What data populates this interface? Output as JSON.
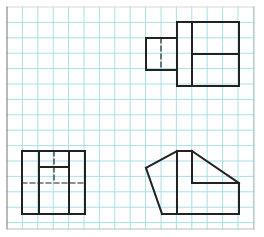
{
  "colors": {
    "background": "#ffffff",
    "grid": "#a8e0e6",
    "frame": "#8a8a8a",
    "line": "#222222"
  },
  "grid": {
    "origin_x": 7,
    "origin_y": 7,
    "spacing": 15.4,
    "width": 247,
    "height": 222
  },
  "views": [
    {
      "name": "top-right-view",
      "solid_lines": [
        [
          177,
          22,
          239,
          22
        ],
        [
          239,
          22,
          239,
          86
        ],
        [
          239,
          86,
          177,
          86
        ],
        [
          177,
          86,
          177,
          22
        ],
        [
          192,
          22,
          192,
          86
        ],
        [
          192,
          54,
          239,
          54
        ],
        [
          146,
          38,
          177,
          38
        ],
        [
          146,
          70,
          177,
          70
        ],
        [
          146,
          38,
          146,
          70
        ]
      ],
      "dashed_lines": [
        [
          161,
          38,
          161,
          70
        ]
      ]
    },
    {
      "name": "bottom-left-view",
      "solid_lines": [
        [
          22,
          151,
          85,
          151
        ],
        [
          85,
          151,
          85,
          214
        ],
        [
          85,
          214,
          22,
          214
        ],
        [
          22,
          214,
          22,
          151
        ],
        [
          39,
          151,
          39,
          214
        ],
        [
          69,
          151,
          69,
          214
        ],
        [
          39,
          167,
          69,
          167
        ]
      ],
      "dashed_lines": [
        [
          22,
          183,
          85,
          183
        ],
        [
          54,
          151,
          54,
          183
        ]
      ]
    },
    {
      "name": "bottom-right-view",
      "solid_lines": [
        [
          146,
          168,
          177,
          151
        ],
        [
          177,
          151,
          192,
          151
        ],
        [
          192,
          151,
          239,
          183
        ],
        [
          239,
          183,
          239,
          214
        ],
        [
          239,
          214,
          162,
          214
        ],
        [
          162,
          214,
          146,
          168
        ],
        [
          177,
          151,
          177,
          214
        ],
        [
          192,
          151,
          192,
          183
        ],
        [
          192,
          183,
          239,
          183
        ]
      ],
      "dashed_lines": []
    }
  ]
}
